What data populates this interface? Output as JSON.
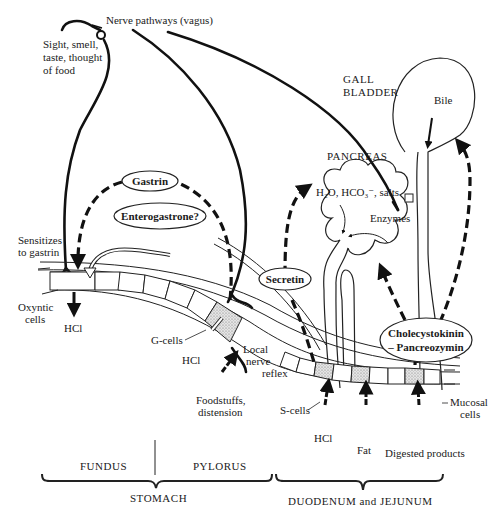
{
  "diagram": {
    "labels": {
      "nerve_pathways": "Nerve pathways (vagus)",
      "sight_line1": "Sight, smell,",
      "sight_line2": "taste, thought",
      "sight_line3": "of food",
      "gall_bladder_line1": "GALL",
      "gall_bladder_line2": "BLADDER",
      "bile": "Bile",
      "pancreas": "PANCREAS",
      "pancreas_secretion": "H₂O, HCO₃⁻, salts",
      "enzymes": "Enzymes",
      "gastrin": "Gastrin",
      "enterogastrone": "Enterogastrone?",
      "secretin": "Secretin",
      "cck_line1": "Cholecystokinin",
      "cck_line2": "– Pancreozymin",
      "sensitizes_line1": "Sensitizes",
      "sensitizes_line2": "to gastrin",
      "oxyntic_line1": "Oxyntic",
      "oxyntic_line2": "cells",
      "hcl_stomach": "HCl",
      "g_cells": "G-cells",
      "hcl_pylorus": "HCl",
      "local_line1": "Local",
      "local_line2": "nerve",
      "local_line3": "reflex",
      "foodstuffs_line1": "Foodstuffs,",
      "foodstuffs_line2": "distension",
      "s_cells": "S-cells",
      "hcl_duodenum": "HCl",
      "fat": "Fat",
      "digested_products": "Digested products",
      "mucosal_line1": "Mucosal",
      "mucosal_line2": "cells"
    },
    "regions": {
      "fundus": "FUNDUS",
      "pylorus": "PYLORUS",
      "stomach": "STOMACH",
      "duodenum": "DUODENUM and JEJUNUM"
    },
    "colors": {
      "ink": "#111111",
      "background": "#ffffff",
      "stipple": "#bdbdbd"
    }
  }
}
